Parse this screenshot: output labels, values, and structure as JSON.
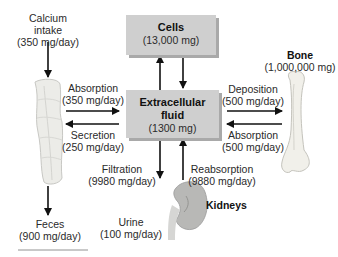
{
  "diagram": {
    "nodes": {
      "intake": {
        "label": "Calcium",
        "label2": "intake",
        "value": "(350 mg/day)"
      },
      "cells": {
        "label": "Cells",
        "value": "(13,000 mg)"
      },
      "ecf": {
        "label": "Extracellular",
        "label2": "fluid",
        "value": "(1300 mg)"
      },
      "bone": {
        "label": "Bone",
        "value": "(1,000,000 mg)"
      },
      "feces": {
        "label": "Feces",
        "value": "(900 mg/day)"
      },
      "urine": {
        "label": "Urine",
        "value": "(100 mg/day)"
      },
      "kidneys": {
        "label": "Kidneys"
      }
    },
    "flows": {
      "gut_absorption": {
        "label": "Absorption",
        "value": "(350 mg/day)"
      },
      "secretion": {
        "label": "Secretion",
        "value": "(250 mg/day)"
      },
      "deposition": {
        "label": "Deposition",
        "value": "(500 mg/day)"
      },
      "bone_absorption": {
        "label": "Absorption",
        "value": "(500 mg/day)"
      },
      "filtration": {
        "label": "Filtration",
        "value": "(9980 mg/day)"
      },
      "reabsorption": {
        "label": "Reabsorption",
        "value": "(9880 mg/day)"
      }
    },
    "colors": {
      "box": "#cfcfcf",
      "box_shadow": "#a9a9a9",
      "arrow": "#111111",
      "organ": "#e6e6e2"
    }
  }
}
